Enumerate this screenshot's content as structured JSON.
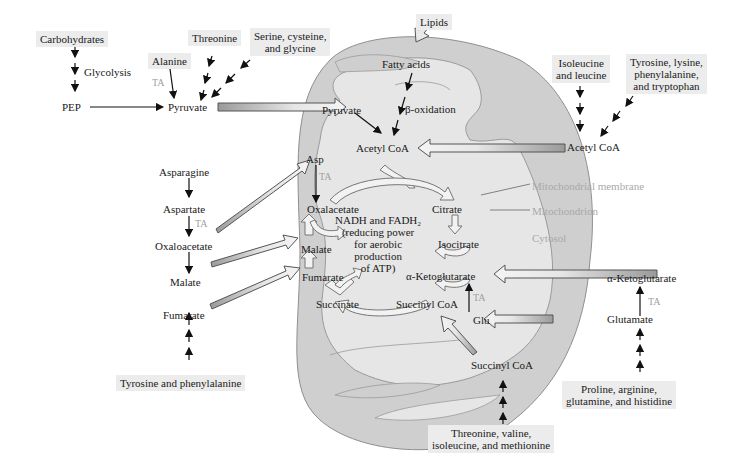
{
  "diagram": {
    "colors": {
      "mitochondrion_outer": "#cfcfcf",
      "mitochondrion_inner": "#e6e6e6",
      "label_box": "#ececec",
      "compartment_label": "#a9a9a9",
      "transamination_label": "#a0a0a0",
      "arrow_fill": "#e8e8e8",
      "text": "#1a1a1a"
    },
    "cytosol": {
      "carbohydrates": "Carbohydrates",
      "glycolysis": "Glycolysis",
      "pep": "PEP",
      "alanine": "Alanine",
      "threonine": "Threonine",
      "serine_group": "Serine, cysteine,\nand glycine",
      "pyruvate": "Pyruvate",
      "lipids": "Lipids",
      "isoleucine_leucine": "Isoleucine\nand leucine",
      "tyr_lys_phe_trp": "Tyrosine, lysine,\nphenylalanine,\nand tryptophan",
      "acetyl_coa": "Acetyl CoA",
      "asparagine": "Asparagine",
      "aspartate": "Aspartate",
      "oxaloacetate": "Oxaloacetate",
      "malate": "Malate",
      "fumarate": "Fumarate",
      "tyr_phe": "Tyrosine and phenylalanine",
      "alpha_ketoglutarate": "α-Ketoglutarate",
      "glutamate": "Glutamate",
      "pro_arg_gln_his": "Proline, arginine,\nglutamine, and histidine",
      "succinyl_coa": "Succinyl CoA",
      "thr_val_ile_met": "Threonine, valine,\nisoleucine, and methionine",
      "ta": "TA"
    },
    "mitochondrion": {
      "fatty_acids": "Fatty acids",
      "beta_oxidation": "β-oxidation",
      "pyruvate": "Pyruvate",
      "acetyl_coa": "Acetyl CoA",
      "asp": "Asp",
      "ta": "TA",
      "oxalacetate": "Oxalacetate",
      "citrate": "Citrate",
      "isocitrate": "Isocitrate",
      "alpha_ketoglutarate": "α-Ketoglutarate",
      "succinyl_coa": "Succinyl CoA",
      "succinate": "Succinate",
      "fumarate": "Fumarate",
      "malate": "Malate",
      "glu": "Glu",
      "center_note": "NADH and FADH₂\n(reducing power\nfor aerobic\nproduction\nof ATP)"
    },
    "legend": {
      "membrane": "Mitochondrial membrane",
      "mitochondrion": "Mitochondrion",
      "cytosol": "Cytosol"
    }
  }
}
